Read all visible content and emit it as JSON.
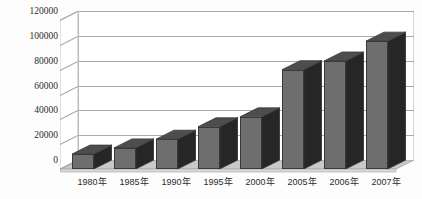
{
  "chart_data": {
    "type": "bar",
    "title": "",
    "subtitle": "",
    "xlabel": "",
    "ylabel": "",
    "categories": [
      "1980年",
      "1985年",
      "1990年",
      "1995年",
      "2000年",
      "2005年",
      "2006年",
      "2007年"
    ],
    "values": [
      12000,
      17000,
      24000,
      34000,
      42000,
      80000,
      87000,
      103000
    ],
    "series": [
      {
        "name": "",
        "values": [
          12000,
          17000,
          24000,
          34000,
          42000,
          80000,
          87000,
          103000
        ]
      }
    ],
    "ylim": [
      0,
      120000
    ],
    "yticks": [
      0,
      20000,
      40000,
      60000,
      80000,
      100000,
      120000
    ],
    "ytick_labels": [
      "0",
      "20000",
      "40000",
      "60000",
      "80000",
      "100000",
      "120000"
    ],
    "grid": true,
    "grid_axis": "y",
    "legend": false,
    "legend_position": "none",
    "style": "3d-column",
    "bar_face_color": "#6e6e6e",
    "bar_side_color": "#262626",
    "bar_top_color": "#4d4d4d",
    "bar_edge_color": "#3a3a3a",
    "grid_color": "#a9a9a9",
    "floor_color": "#c9c9c9",
    "wall_color": "#ffffff",
    "background_color": "#fdfdfd",
    "text_color": "#2b2b2b"
  },
  "axes": {
    "y": {
      "ticks": [
        {
          "label": "120000",
          "value": 120000
        },
        {
          "label": "100000",
          "value": 100000
        },
        {
          "label": "80000",
          "value": 80000
        },
        {
          "label": "60000",
          "value": 60000
        },
        {
          "label": "40000",
          "value": 40000
        },
        {
          "label": "20000",
          "value": 20000
        },
        {
          "label": "0",
          "value": 0
        }
      ]
    },
    "x": {
      "ticks": [
        {
          "label": "1980年"
        },
        {
          "label": "1985年"
        },
        {
          "label": "1990年"
        },
        {
          "label": "1995年"
        },
        {
          "label": "2000年"
        },
        {
          "label": "2005年"
        },
        {
          "label": "2006年"
        },
        {
          "label": "2007年"
        }
      ]
    }
  }
}
